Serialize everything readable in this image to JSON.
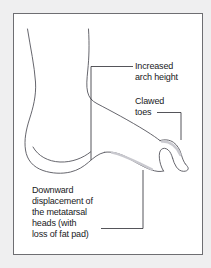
{
  "figure": {
    "type": "medical-illustration",
    "panel": {
      "background_color": "#ffffff",
      "border_color": "#6e6e72",
      "outer_background_color": "#efeff0"
    },
    "line_color": "#4a4a50",
    "text_color": "#19191c"
  },
  "labels": {
    "arch": {
      "text": "Increased\narch height",
      "line1": "Increased",
      "line2": "arch height"
    },
    "toes": {
      "text": "Clawed\ntoes",
      "line1": "Clawed",
      "line2": "toes"
    },
    "metatarsal": {
      "text": "Downward\ndisplacement of\nthe metatarsal\nheads (with\nloss of fat pad)",
      "line1": "Downward",
      "line2": "displacement of",
      "line3": "the metatarsal",
      "line4": "heads (with",
      "line5": "loss of fat pad)"
    }
  },
  "leader_lines": {
    "arch": "horizontal from text left edge to x=91, then vertical down to arch apex",
    "toes": "horizontal right from text to x=181, then vertical down to toe",
    "metatarsal": "horizontal right from last text line to x=143, then vertical up to sole"
  }
}
